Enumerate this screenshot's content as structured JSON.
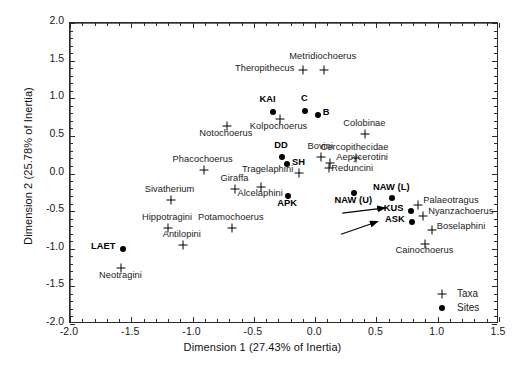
{
  "chart_data": {
    "type": "scatter",
    "title": "",
    "xlabel": "Dimension 1 (27.43% of Inertia)",
    "ylabel": "Dimension 2 (25.78% of Inertia)",
    "xlim": [
      -2.0,
      1.5
    ],
    "ylim": [
      -2.0,
      2.0
    ],
    "xticks": [
      "-2.0",
      "-1.5",
      "-1.0",
      "-0.5",
      "0.0",
      "0.5",
      "1.0",
      "1.5"
    ],
    "xtick_values": [
      -2.0,
      -1.5,
      -1.0,
      -0.5,
      0.0,
      0.5,
      1.0,
      1.5
    ],
    "yticks": [
      "2.0",
      "1.5",
      "1.0",
      "0.5",
      "0.0",
      "-0.5",
      "-1.0",
      "-1.5",
      "-2.0"
    ],
    "ytick_values": [
      2.0,
      1.5,
      1.0,
      0.5,
      0.0,
      -0.5,
      -1.0,
      -1.5,
      -2.0
    ],
    "grid": false,
    "legend_position": "bottom-right",
    "legend": [
      {
        "label": "Taxa",
        "marker": "plus-cross-icon"
      },
      {
        "label": "Sites",
        "marker": "filled-circle-icon"
      }
    ],
    "series": [
      {
        "name": "Taxa",
        "marker": "plus",
        "points": [
          {
            "label": "Metridiochoerus",
            "x": 0.07,
            "y": 1.38,
            "lx": 0.07,
            "ly": 1.54,
            "align": "center"
          },
          {
            "label": "Theropithecus",
            "x": -0.1,
            "y": 1.38,
            "lx": -0.16,
            "ly": 1.38,
            "align": "right"
          },
          {
            "label": "Kolpochoerus",
            "x": -0.29,
            "y": 0.72,
            "lx": -0.29,
            "ly": 0.6,
            "align": "center"
          },
          {
            "label": "Notochoerus",
            "x": -0.72,
            "y": 0.63,
            "lx": -0.72,
            "ly": 0.51,
            "align": "center"
          },
          {
            "label": "Colobinae",
            "x": 0.41,
            "y": 0.52,
            "lx": 0.41,
            "ly": 0.64,
            "align": "center"
          },
          {
            "label": "Phacochoerus",
            "x": -0.91,
            "y": 0.05,
            "lx": -0.91,
            "ly": 0.17,
            "align": "center"
          },
          {
            "label": "Bovini",
            "x": 0.05,
            "y": 0.22,
            "lx": 0.05,
            "ly": 0.34,
            "align": "center"
          },
          {
            "label": "Cercopithecidae",
            "x": 0.33,
            "y": 0.2,
            "lx": 0.33,
            "ly": 0.32,
            "align": "center"
          },
          {
            "label": "Aepycerotini",
            "x": 0.12,
            "y": 0.14,
            "lx": 0.18,
            "ly": 0.19,
            "align": "left"
          },
          {
            "label": "Reduncini",
            "x": 0.11,
            "y": 0.07,
            "lx": 0.14,
            "ly": 0.05,
            "align": "left"
          },
          {
            "label": "Tragelaphini",
            "x": -0.13,
            "y": 0.01,
            "lx": -0.17,
            "ly": 0.03,
            "align": "right"
          },
          {
            "label": "Giraffa",
            "x": -0.65,
            "y": -0.2,
            "lx": -0.65,
            "ly": -0.08,
            "align": "center"
          },
          {
            "label": "Alcelaphini",
            "x": -0.44,
            "y": -0.18,
            "lx": -0.44,
            "ly": -0.28,
            "align": "center"
          },
          {
            "label": "Sivatherium",
            "x": -1.18,
            "y": -0.35,
            "lx": -1.18,
            "ly": -0.23,
            "align": "center"
          },
          {
            "label": "Palaeotragus",
            "x": 0.84,
            "y": -0.42,
            "lx": 0.89,
            "ly": -0.38,
            "align": "left"
          },
          {
            "label": "Nyanzachoerus",
            "x": 0.88,
            "y": -0.56,
            "lx": 0.93,
            "ly": -0.52,
            "align": "left"
          },
          {
            "label": "Potamochoerus",
            "x": -0.68,
            "y": -0.72,
            "lx": -0.68,
            "ly": -0.6,
            "align": "center"
          },
          {
            "label": "Hippotragini",
            "x": -1.2,
            "y": -0.72,
            "lx": -1.2,
            "ly": -0.6,
            "align": "center"
          },
          {
            "label": "Boselaphini",
            "x": 0.95,
            "y": -0.75,
            "lx": 1.0,
            "ly": -0.73,
            "align": "left"
          },
          {
            "label": "Antilopini",
            "x": -1.08,
            "y": -0.95,
            "lx": -1.08,
            "ly": -0.83,
            "align": "center"
          },
          {
            "label": "Cainochoerus",
            "x": 0.9,
            "y": -0.94,
            "lx": 0.9,
            "ly": -1.04,
            "align": "center"
          },
          {
            "label": "Neotragini",
            "x": -1.58,
            "y": -1.26,
            "lx": -1.58,
            "ly": -1.37,
            "align": "center"
          }
        ]
      },
      {
        "name": "Sites",
        "marker": "dot",
        "points": [
          {
            "label": "KAI",
            "x": -0.34,
            "y": 0.82,
            "lx": -0.38,
            "ly": 0.97,
            "align": "center"
          },
          {
            "label": "C",
            "x": -0.08,
            "y": 0.83,
            "lx": -0.08,
            "ly": 0.98,
            "align": "center"
          },
          {
            "label": "B",
            "x": 0.02,
            "y": 0.78,
            "lx": 0.07,
            "ly": 0.79,
            "align": "left"
          },
          {
            "label": "DD",
            "x": -0.27,
            "y": 0.22,
            "lx": -0.27,
            "ly": 0.35,
            "align": "center"
          },
          {
            "label": "SH",
            "x": -0.23,
            "y": 0.12,
            "lx": -0.18,
            "ly": 0.12,
            "align": "left"
          },
          {
            "label": "APK",
            "x": -0.22,
            "y": -0.3,
            "lx": -0.22,
            "ly": -0.42,
            "align": "center"
          },
          {
            "label": "NAW (U)",
            "x": 0.32,
            "y": -0.26,
            "lx": 0.32,
            "ly": -0.38,
            "align": "center"
          },
          {
            "label": "NAW (L)",
            "x": 0.63,
            "y": -0.33,
            "lx": 0.63,
            "ly": -0.2,
            "align": "center"
          },
          {
            "label": "KUS",
            "x": 0.78,
            "y": -0.5,
            "lx": 0.73,
            "ly": -0.49,
            "align": "right"
          },
          {
            "label": "ASK",
            "x": 0.79,
            "y": -0.64,
            "lx": 0.74,
            "ly": -0.63,
            "align": "right"
          },
          {
            "label": "LAET",
            "x": -1.57,
            "y": -1.0,
            "lx": -1.62,
            "ly": -0.99,
            "align": "right"
          }
        ]
      }
    ],
    "annotations": [
      {
        "type": "arrow",
        "name": "arrow-to-kus",
        "x1": 0.23,
        "y1": -0.54,
        "x2": 0.58,
        "y2": -0.47
      },
      {
        "type": "arrow",
        "name": "arrow-to-ask",
        "x1": 0.22,
        "y1": -0.82,
        "x2": 0.52,
        "y2": -0.65
      }
    ],
    "colors": {
      "marker": "#000000",
      "frame": "#2b2b2b",
      "zero_axis": "#6e6e6e",
      "text": "#1a1a1a",
      "background": "#ffffff"
    }
  }
}
